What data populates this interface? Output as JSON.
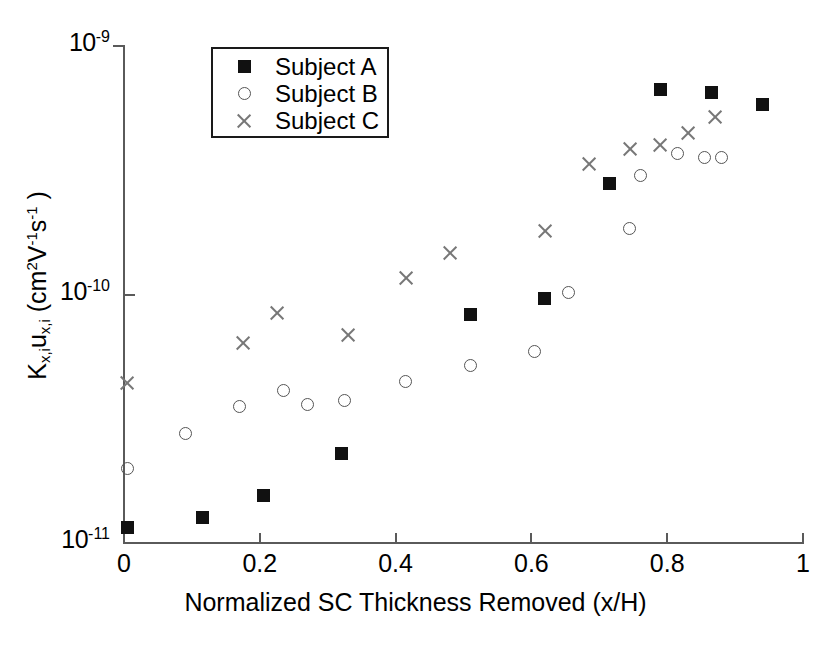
{
  "chart_data": {
    "type": "scatter",
    "title": "",
    "xlabel": "Normalized SC Thickness Removed (x/H)",
    "ylabel": "K_{x,i}u_{x,i} (cm^2 V^-1 s^-1)",
    "ylabel_parts": {
      "k": "K",
      "k_sub": "x,i",
      "u": "u",
      "u_sub": "x,i",
      "unit_open": " (cm",
      "unit_exp1": "2",
      "unit_v": "V",
      "unit_exp2": "-1",
      "unit_s": "s",
      "unit_exp3": "-1",
      "unit_close": " )"
    },
    "xscale": "linear",
    "yscale": "log",
    "xlim": [
      0,
      1
    ],
    "ylim": [
      1e-11,
      1e-09
    ],
    "grid": false,
    "legend_position": "upper-left-inside",
    "xticks": [
      "0",
      "0.2",
      "0.4",
      "0.6",
      "0.8",
      "1"
    ],
    "xtick_values": [
      0,
      0.2,
      0.4,
      0.6,
      0.8,
      1
    ],
    "yticks": [
      "10-9",
      "10-10",
      "10-11"
    ],
    "ytick_mantissa": "10",
    "ytick_exponents": [
      "-9",
      "-10",
      "-11"
    ],
    "ytick_values": [
      1e-09,
      1e-10,
      1e-11
    ],
    "series": [
      {
        "name": "Subject A",
        "marker": "filled-square",
        "color": "#111111",
        "points": [
          {
            "x": 0.005,
            "y": 1.15e-11
          },
          {
            "x": 0.115,
            "y": 1.27e-11
          },
          {
            "x": 0.205,
            "y": 1.55e-11
          },
          {
            "x": 0.32,
            "y": 2.3e-11
          },
          {
            "x": 0.51,
            "y": 8.3e-11
          },
          {
            "x": 0.62,
            "y": 9.6e-11
          },
          {
            "x": 0.715,
            "y": 2.8e-10
          },
          {
            "x": 0.79,
            "y": 6.7e-10
          },
          {
            "x": 0.865,
            "y": 6.5e-10
          },
          {
            "x": 0.94,
            "y": 5.8e-10
          }
        ]
      },
      {
        "name": "Subject B",
        "marker": "open-circle",
        "color": "#555555",
        "points": [
          {
            "x": 0.005,
            "y": 2e-11
          },
          {
            "x": 0.09,
            "y": 2.75e-11
          },
          {
            "x": 0.17,
            "y": 3.55e-11
          },
          {
            "x": 0.235,
            "y": 4.1e-11
          },
          {
            "x": 0.27,
            "y": 3.6e-11
          },
          {
            "x": 0.325,
            "y": 3.75e-11
          },
          {
            "x": 0.415,
            "y": 4.45e-11
          },
          {
            "x": 0.51,
            "y": 5.2e-11
          },
          {
            "x": 0.605,
            "y": 5.9e-11
          },
          {
            "x": 0.655,
            "y": 1.02e-10
          },
          {
            "x": 0.745,
            "y": 1.85e-10
          },
          {
            "x": 0.76,
            "y": 3e-10
          },
          {
            "x": 0.815,
            "y": 3.7e-10
          },
          {
            "x": 0.855,
            "y": 3.55e-10
          },
          {
            "x": 0.88,
            "y": 3.55e-10
          }
        ]
      },
      {
        "name": "Subject C",
        "marker": "x-cross",
        "color": "#777777",
        "points": [
          {
            "x": 0.005,
            "y": 4.4e-11
          },
          {
            "x": 0.175,
            "y": 6.4e-11
          },
          {
            "x": 0.225,
            "y": 8.4e-11
          },
          {
            "x": 0.33,
            "y": 6.9e-11
          },
          {
            "x": 0.415,
            "y": 1.16e-10
          },
          {
            "x": 0.48,
            "y": 1.47e-10
          },
          {
            "x": 0.62,
            "y": 1.8e-10
          },
          {
            "x": 0.685,
            "y": 3.35e-10
          },
          {
            "x": 0.745,
            "y": 3.85e-10
          },
          {
            "x": 0.79,
            "y": 4e-10
          },
          {
            "x": 0.83,
            "y": 4.45e-10
          },
          {
            "x": 0.87,
            "y": 5.2e-10
          }
        ]
      }
    ]
  },
  "legend": {
    "items": [
      {
        "label": "Subject A",
        "marker": "filled-square"
      },
      {
        "label": "Subject B",
        "marker": "open-circle"
      },
      {
        "label": "Subject C",
        "marker": "x-cross"
      }
    ]
  },
  "caption": {
    "text": ""
  }
}
